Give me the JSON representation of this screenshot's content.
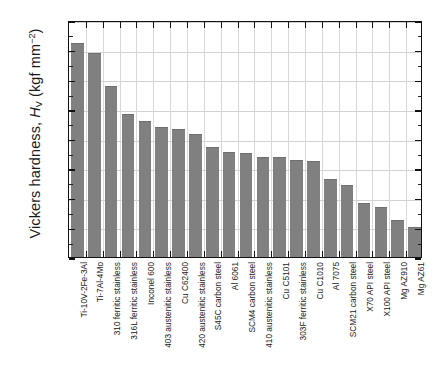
{
  "chart_data": {
    "type": "bar",
    "title": "",
    "xlabel": "",
    "ylabel": "Vickers hardness, H_V (kgf mm^-2)",
    "ylabel_parts": {
      "prefix": "Vickers hardness, ",
      "symbol": "H",
      "symbol_sub": "V",
      "unit_open": " (kgf mm",
      "unit_sup": "−2",
      "unit_close": ")"
    },
    "ylim": [
      0,
      400
    ],
    "ytick_step": 50,
    "yticks": [
      "0",
      "50",
      "100",
      "150",
      "200",
      "250",
      "300",
      "350",
      "400"
    ],
    "grid": true,
    "legend": "none",
    "bar_color": "#808080",
    "categories": [
      "Ti-10V-2Fe-3Al",
      "Ti-7Al-4Mo",
      "310 ferritic stainless",
      "316L ferritic stainless",
      "Inconel 600",
      "403 austenitic stainless",
      "Cu C62400",
      "420 austenitic stainless",
      "S45C carbon steel",
      "Al 6061",
      "SCM4 carbon steel",
      "410 austenitic stainless",
      "Cu C5101",
      "303F ferritic stainless",
      "Cu C1010",
      "Al 7075",
      "SCM21 carbon steel",
      "X70 API steel",
      "X100 API steel",
      "Mg AZ910",
      "Mg AZ61"
    ],
    "values": [
      362,
      344,
      289,
      242,
      230,
      219,
      216,
      207,
      185,
      178,
      176,
      169,
      169,
      164,
      162,
      132,
      122,
      91,
      85,
      63,
      51
    ]
  }
}
